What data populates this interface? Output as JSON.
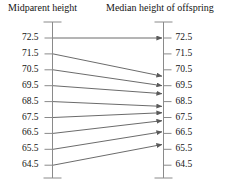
{
  "figure": {
    "type": "diagram",
    "background_color": "#ffffff",
    "line_color": "#5a5a5a",
    "axis_color": "#8a8a8a",
    "text_color": "#141414"
  },
  "columns": {
    "left_title": "Midparent height",
    "right_title": "Median height of offspring"
  },
  "left_axis": {
    "name": "midparent-height-axis",
    "tick_labels": [
      "72.5",
      "71.5",
      "70.5",
      "69.5",
      "68.5",
      "67.5",
      "66.5",
      "65.5",
      "64.5"
    ]
  },
  "right_axis": {
    "name": "median-offspring-height-axis",
    "tick_labels": [
      "72.5",
      "71.5",
      "70.5",
      "69.5",
      "68.5",
      "67.5",
      "66.5",
      "65.5",
      "64.5"
    ]
  },
  "chart_data": {
    "type": "slope",
    "title": "",
    "xlabel": "",
    "ylabel": "",
    "left_axis_label": "Midparent height",
    "right_axis_label": "Median height of offspring",
    "categories": [
      "72.5",
      "71.5",
      "70.5",
      "69.5",
      "68.5",
      "67.5",
      "66.5",
      "65.5",
      "64.5"
    ],
    "ylim": [
      64.5,
      72.5
    ],
    "grid": false,
    "legend": "none",
    "arrows": [
      {
        "from": 72.5,
        "to": 72.5
      },
      {
        "from": 71.5,
        "to": 70.1
      },
      {
        "from": 70.5,
        "to": 69.5
      },
      {
        "from": 69.5,
        "to": 69.0
      },
      {
        "from": 68.5,
        "to": 68.2
      },
      {
        "from": 67.5,
        "to": 67.8
      },
      {
        "from": 66.5,
        "to": 67.3
      },
      {
        "from": 65.5,
        "to": 66.6
      },
      {
        "from": 64.5,
        "to": 65.8
      }
    ]
  }
}
